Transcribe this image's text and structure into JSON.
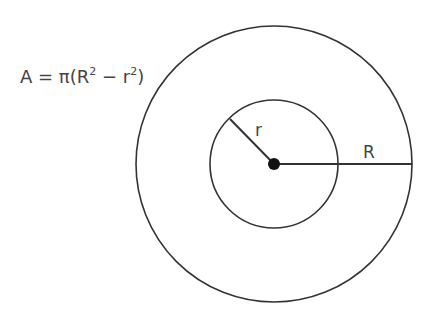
{
  "diagram": {
    "formula": {
      "lhs": "A = π(R",
      "exp1": "2",
      "mid": " − r",
      "exp2": "2",
      "rhs": ")"
    },
    "labels": {
      "inner_radius": "r",
      "outer_radius": "R"
    },
    "geometry": {
      "center": [
        274,
        164
      ],
      "inner_radius_px": 64,
      "outer_radius_px": 138
    },
    "colors": {
      "stroke": "#333333",
      "text": "#444444"
    }
  }
}
